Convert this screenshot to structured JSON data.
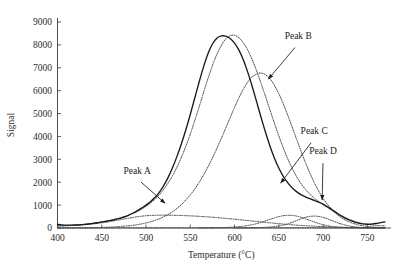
{
  "chart_data": {
    "type": "line",
    "title": "",
    "xlabel": "Temperature (°C)",
    "ylabel": "Signal",
    "xlim": [
      400,
      770
    ],
    "ylim": [
      0,
      9000
    ],
    "xticks": [
      400,
      450,
      500,
      550,
      600,
      650,
      700,
      750
    ],
    "yticks": [
      0,
      1000,
      2000,
      3000,
      4000,
      5000,
      6000,
      7000,
      8000,
      9000
    ],
    "grid": false,
    "legend": null,
    "annotations": [
      {
        "label": "Peak A",
        "text_x": 490,
        "text_y": 2350,
        "target_x": 523,
        "target_y": 1030
      },
      {
        "label": "Peak B",
        "text_x": 672,
        "text_y": 8250,
        "target_x": 637,
        "target_y": 6450
      },
      {
        "label": "Peak C",
        "text_x": 690,
        "text_y": 4100,
        "target_x": 651,
        "target_y": 1900
      },
      {
        "label": "Peak D",
        "text_x": 700,
        "text_y": 3250,
        "target_x": 699,
        "target_y": 1150
      }
    ],
    "series": [
      {
        "name": "Measured signal",
        "style": "solid",
        "x": [
          400,
          405,
          410,
          415,
          420,
          425,
          430,
          435,
          440,
          445,
          450,
          455,
          460,
          465,
          470,
          475,
          480,
          485,
          490,
          495,
          500,
          505,
          510,
          515,
          520,
          525,
          530,
          535,
          540,
          545,
          550,
          555,
          560,
          565,
          570,
          575,
          580,
          585,
          590,
          595,
          600,
          605,
          610,
          615,
          620,
          625,
          630,
          635,
          640,
          645,
          650,
          655,
          660,
          665,
          670,
          675,
          680,
          685,
          690,
          695,
          700,
          705,
          710,
          715,
          720,
          725,
          730,
          735,
          740,
          745,
          750,
          755,
          760,
          765,
          770
        ],
        "y": [
          155,
          135,
          125,
          125,
          130,
          140,
          155,
          175,
          200,
          230,
          265,
          295,
          330,
          370,
          420,
          480,
          555,
          645,
          750,
          870,
          1000,
          1150,
          1330,
          1560,
          1850,
          2210,
          2640,
          3130,
          3680,
          4290,
          4960,
          5670,
          6380,
          7040,
          7610,
          8040,
          8290,
          8390,
          8380,
          8280,
          8080,
          7770,
          7340,
          6800,
          6180,
          5510,
          4830,
          4180,
          3580,
          3060,
          2620,
          2260,
          1980,
          1760,
          1590,
          1460,
          1360,
          1280,
          1210,
          1130,
          1040,
          930,
          800,
          670,
          540,
          430,
          340,
          270,
          215,
          180,
          165,
          170,
          195,
          235,
          265
        ]
      },
      {
        "name": "Fitted sum",
        "style": "dotted",
        "x": [
          400,
          410,
          420,
          430,
          440,
          450,
          460,
          470,
          480,
          490,
          500,
          510,
          520,
          530,
          540,
          550,
          560,
          570,
          580,
          590,
          600,
          610,
          620,
          630,
          640,
          650,
          660,
          670,
          680,
          690,
          700,
          710,
          720,
          730,
          740,
          750,
          760,
          770
        ],
        "y": [
          95,
          105,
          125,
          155,
          200,
          260,
          335,
          430,
          555,
          720,
          945,
          1255,
          1690,
          2290,
          3090,
          4100,
          5290,
          6530,
          7580,
          8250,
          8420,
          8090,
          7350,
          6320,
          5160,
          4030,
          3030,
          2250,
          1690,
          1310,
          1020,
          770,
          550,
          370,
          240,
          160,
          115,
          95
        ]
      },
      {
        "name": "Peak A component",
        "style": "dotted",
        "x": [
          400,
          410,
          420,
          430,
          440,
          450,
          460,
          470,
          480,
          490,
          500,
          510,
          520,
          530,
          540,
          550,
          560,
          570,
          580,
          590,
          600,
          610,
          620,
          630,
          640,
          650,
          660,
          670,
          680,
          690,
          700,
          710,
          720,
          730,
          740,
          750,
          760,
          770
        ],
        "y": [
          90,
          100,
          115,
          140,
          175,
          225,
          285,
          355,
          425,
          490,
          535,
          555,
          560,
          555,
          545,
          530,
          510,
          485,
          455,
          420,
          385,
          345,
          305,
          265,
          225,
          190,
          155,
          125,
          100,
          80,
          62,
          48,
          36,
          27,
          20,
          15,
          11,
          8
        ]
      },
      {
        "name": "Peak B component",
        "style": "dotted",
        "x": [
          400,
          420,
          440,
          460,
          480,
          490,
          500,
          510,
          520,
          530,
          540,
          550,
          560,
          570,
          580,
          590,
          600,
          605,
          610,
          615,
          620,
          630,
          640,
          650,
          660,
          670,
          680,
          690,
          700,
          710,
          720,
          730,
          740,
          750,
          760,
          770
        ],
        "y": [
          2,
          5,
          14,
          38,
          95,
          145,
          220,
          330,
          490,
          715,
          1025,
          1445,
          1990,
          2670,
          3470,
          4360,
          5270,
          5690,
          6070,
          6380,
          6610,
          6770,
          6520,
          5870,
          4940,
          3890,
          2870,
          1990,
          1300,
          805,
          470,
          260,
          135,
          67,
          31,
          14
        ]
      },
      {
        "name": "Peak C component",
        "style": "dotted",
        "x": [
          560,
          575,
          590,
          600,
          610,
          620,
          625,
          630,
          635,
          640,
          645,
          650,
          655,
          660,
          665,
          670,
          675,
          680,
          685,
          690,
          695,
          700,
          710,
          720,
          730,
          740,
          750,
          760,
          770
        ],
        "y": [
          3,
          8,
          22,
          42,
          80,
          145,
          190,
          245,
          310,
          375,
          440,
          495,
          535,
          555,
          550,
          520,
          470,
          405,
          335,
          265,
          200,
          145,
          65,
          25,
          9,
          3,
          1,
          0,
          0
        ]
      },
      {
        "name": "Peak D component",
        "style": "dotted",
        "x": [
          600,
          615,
          630,
          640,
          650,
          655,
          660,
          665,
          670,
          675,
          680,
          685,
          690,
          695,
          700,
          705,
          710,
          715,
          720,
          730,
          740,
          750,
          760,
          770
        ],
        "y": [
          2,
          6,
          20,
          42,
          90,
          130,
          180,
          245,
          320,
          400,
          465,
          505,
          520,
          505,
          465,
          400,
          325,
          250,
          182,
          85,
          33,
          11,
          3,
          1
        ]
      },
      {
        "name": "Baseline",
        "style": "dotted",
        "x": [
          400,
          770
        ],
        "y": [
          8,
          8
        ]
      }
    ]
  },
  "axes": {
    "x_tick_labels": [
      "400",
      "450",
      "500",
      "550",
      "600",
      "650",
      "700",
      "750"
    ],
    "y_tick_labels": [
      "0",
      "1000",
      "2000",
      "3000",
      "4000",
      "5000",
      "6000",
      "7000",
      "8000",
      "9000"
    ]
  },
  "labels": {
    "peak_a": "Peak A",
    "peak_b": "Peak B",
    "peak_c": "Peak C",
    "peak_d": "Peak D",
    "x_axis": "Temperature (°C)",
    "y_axis": "Signal"
  }
}
